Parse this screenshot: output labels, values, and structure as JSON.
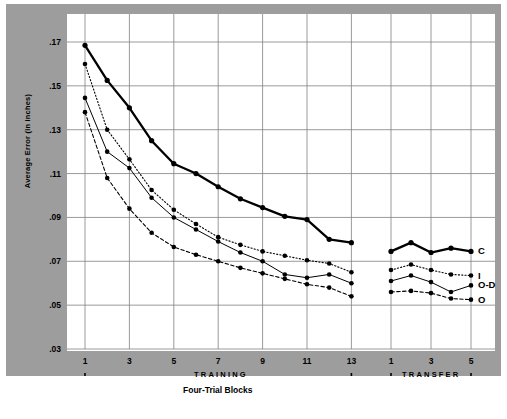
{
  "chart_data": {
    "type": "line",
    "title": "",
    "xlabel": "Four-Trial Blocks",
    "ylabel": "Average Error (in inches)",
    "ylim": [
      0.02,
      0.18
    ],
    "yticks": [
      ".17",
      ".15",
      ".13",
      ".11",
      ".09",
      ".07",
      ".05",
      ".03"
    ],
    "ytick_values": [
      0.17,
      0.15,
      0.13,
      0.11,
      0.09,
      0.07,
      0.05,
      0.03
    ],
    "grid": true,
    "legend_position": "right-inline",
    "phases": [
      {
        "name": "TRAINING",
        "xticks": [
          "1",
          "3",
          "5",
          "7",
          "9",
          "11",
          "13"
        ],
        "blocks": [
          1,
          2,
          3,
          4,
          5,
          6,
          7,
          8,
          9,
          10,
          11,
          12,
          13
        ]
      },
      {
        "name": "TRANSFER",
        "xticks": [
          "1",
          "3",
          "5"
        ],
        "blocks": [
          1,
          2,
          3,
          4,
          5
        ]
      }
    ],
    "series": [
      {
        "name": "C",
        "label": "C",
        "style": "solid-thick",
        "training": [
          0.1685,
          0.1525,
          0.14,
          0.125,
          0.1145,
          0.11,
          0.104,
          0.0985,
          0.0945,
          0.0905,
          0.089,
          0.08,
          0.0785
        ],
        "transfer": [
          0.0745,
          0.0785,
          0.074,
          0.076,
          0.0745
        ]
      },
      {
        "name": "I",
        "label": "I",
        "style": "dotted",
        "training": [
          0.16,
          0.13,
          0.1165,
          0.1025,
          0.0935,
          0.087,
          0.081,
          0.0775,
          0.0745,
          0.0725,
          0.0705,
          0.069,
          0.065
        ],
        "transfer": [
          0.066,
          0.0685,
          0.066,
          0.064,
          0.0635
        ]
      },
      {
        "name": "O-D",
        "label": "O-D",
        "style": "solid-thin",
        "training": [
          0.1445,
          0.12,
          0.1125,
          0.099,
          0.09,
          0.0845,
          0.079,
          0.074,
          0.07,
          0.064,
          0.0625,
          0.064,
          0.06
        ],
        "transfer": [
          0.061,
          0.0635,
          0.0605,
          0.056,
          0.059
        ]
      },
      {
        "name": "O",
        "label": "O",
        "style": "dashed",
        "training": [
          0.138,
          0.108,
          0.094,
          0.083,
          0.0765,
          0.073,
          0.07,
          0.067,
          0.0645,
          0.062,
          0.0595,
          0.058,
          0.054
        ],
        "transfer": [
          0.056,
          0.0565,
          0.0555,
          0.053,
          0.0525
        ]
      }
    ],
    "colors": {
      "plot_background": "#ffffff",
      "figure_background": "#9d9d9d",
      "grid": "#808080",
      "line": "#000000",
      "page_background": "#ffffff"
    }
  }
}
